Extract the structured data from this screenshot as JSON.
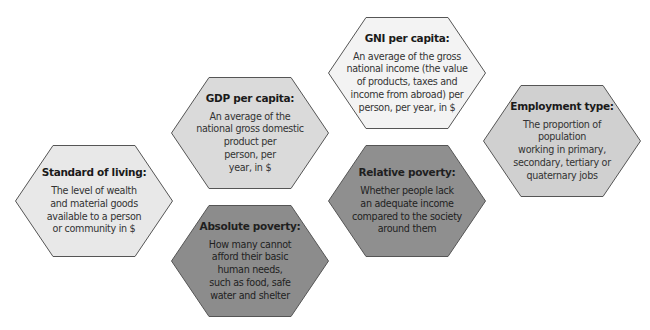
{
  "diagram": {
    "stroke_color": "#555555",
    "hexagons": [
      {
        "id": "standard-of-living",
        "title": "Standard of living:",
        "lines": [
          "The level of wealth",
          "and material goods",
          "available to a person",
          "or community in $"
        ],
        "fill": "#e8e8e8",
        "left": 15,
        "top": 145
      },
      {
        "id": "gdp-per-capita",
        "title": "GDP per capita:",
        "lines": [
          "An average of the",
          "national gross domestic",
          "product per",
          "person, per",
          "year, in $"
        ],
        "fill": "#dadada",
        "left": 171,
        "top": 77
      },
      {
        "id": "absolute-poverty",
        "title": "Absolute poverty:",
        "lines": [
          "How many cannot",
          "afford their basic",
          "human needs,",
          "such as food, safe",
          "water and shelter"
        ],
        "fill": "#8c8c8c",
        "left": 171,
        "top": 205
      },
      {
        "id": "gni-per-capita",
        "title": "GNI per capita:",
        "lines": [
          "An average of the gross",
          "national income (the value",
          "of products, taxes and",
          "income from abroad) per",
          "person, per year, in $"
        ],
        "fill": "#f3f3f3",
        "left": 328,
        "top": 17
      },
      {
        "id": "relative-poverty",
        "title": "Relative poverty:",
        "lines": [
          "Whether people lack",
          "an adequate income",
          "compared to the society",
          "around them"
        ],
        "fill": "#8f8f8f",
        "left": 328,
        "top": 145
      },
      {
        "id": "employment-type",
        "title": "Employment type:",
        "lines": [
          "The proportion of",
          "population",
          "working in primary,",
          "secondary, tertiary or",
          "quaternary jobs"
        ],
        "fill": "#d0d0d0",
        "left": 483,
        "top": 85
      }
    ]
  }
}
